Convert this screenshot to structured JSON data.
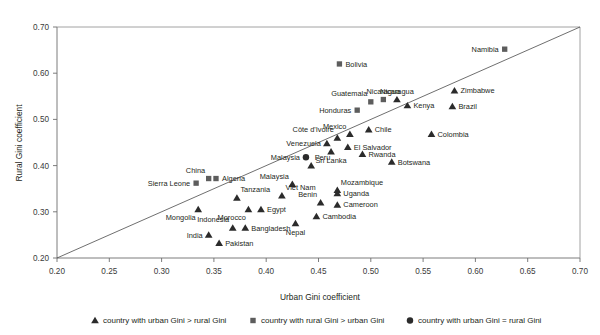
{
  "chart_data": {
    "type": "scatter",
    "title": "",
    "xlabel": "Urban Gini coefficient",
    "ylabel": "Rural Gini coefficient",
    "xlim": [
      0.2,
      0.7
    ],
    "ylim": [
      0.2,
      0.7
    ],
    "xticks": [
      "0.20",
      "0.25",
      "0.30",
      "0.35",
      "0.40",
      "0.45",
      "0.50",
      "0.55",
      "0.60",
      "0.65",
      "0.70"
    ],
    "yticks": [
      "0.20",
      "0.30",
      "0.40",
      "0.50",
      "0.60",
      "0.70"
    ],
    "grid": false,
    "reference_line": {
      "description": "45-degree equality line",
      "from": [
        0.2,
        0.2
      ],
      "to": [
        0.7,
        0.7
      ]
    },
    "legend": {
      "position": "bottom",
      "entries": [
        {
          "marker": "triangle",
          "label": "country with urban Gini > rural Gini"
        },
        {
          "marker": "square",
          "label": "country with rural Gini > urban Gini"
        },
        {
          "marker": "circle",
          "label": "country with urban Gini = rural Gini"
        }
      ]
    },
    "series": [
      {
        "name": "country with urban Gini > rural Gini",
        "marker": "triangle",
        "points": [
          {
            "label": "Mongolia",
            "x": 0.335,
            "y": 0.305,
            "label_pos": "below-left"
          },
          {
            "label": "India",
            "x": 0.345,
            "y": 0.25,
            "label_pos": "left"
          },
          {
            "label": "Indonesia",
            "x": 0.368,
            "y": 0.265,
            "label_pos": "above-left"
          },
          {
            "label": "Bangladesh",
            "x": 0.38,
            "y": 0.265,
            "label_pos": "right"
          },
          {
            "label": "Pakistan",
            "x": 0.355,
            "y": 0.232,
            "label_pos": "right"
          },
          {
            "label": "Morocco",
            "x": 0.383,
            "y": 0.305,
            "label_pos": "below-left"
          },
          {
            "label": "Tanzania",
            "x": 0.372,
            "y": 0.33,
            "label_pos": "above-right"
          },
          {
            "label": "Egypt",
            "x": 0.395,
            "y": 0.305,
            "label_pos": "right"
          },
          {
            "label": "Viet Nam",
            "x": 0.415,
            "y": 0.335,
            "label_pos": "above-right"
          },
          {
            "label": "Malaysia",
            "x": 0.425,
            "y": 0.36,
            "label_pos": "above-left"
          },
          {
            "label": "Nepal",
            "x": 0.428,
            "y": 0.275,
            "label_pos": "below"
          },
          {
            "label": "Cambodia",
            "x": 0.448,
            "y": 0.29,
            "label_pos": "right"
          },
          {
            "label": "Benin",
            "x": 0.452,
            "y": 0.32,
            "label_pos": "above-left"
          },
          {
            "label": "Peru",
            "x": 0.443,
            "y": 0.4,
            "label_pos": "above-right"
          },
          {
            "label": "Cameroon",
            "x": 0.468,
            "y": 0.315,
            "label_pos": "right"
          },
          {
            "label": "Uganda",
            "x": 0.468,
            "y": 0.34,
            "label_pos": "right"
          },
          {
            "label": "Mozambique",
            "x": 0.468,
            "y": 0.347,
            "label_pos": "above-right"
          },
          {
            "label": "Sri Lanka",
            "x": 0.462,
            "y": 0.43,
            "label_pos": "below"
          },
          {
            "label": "Venezuela",
            "x": 0.458,
            "y": 0.448,
            "label_pos": "left"
          },
          {
            "label": "Côte d'Ivoire",
            "x": 0.468,
            "y": 0.46,
            "label_pos": "above-left"
          },
          {
            "label": "El Salvador",
            "x": 0.478,
            "y": 0.44,
            "label_pos": "right"
          },
          {
            "label": "Mexico",
            "x": 0.48,
            "y": 0.468,
            "label_pos": "above-left"
          },
          {
            "label": "Rwanda",
            "x": 0.492,
            "y": 0.425,
            "label_pos": "right"
          },
          {
            "label": "Chile",
            "x": 0.498,
            "y": 0.478,
            "label_pos": "right"
          },
          {
            "label": "Botswana",
            "x": 0.52,
            "y": 0.408,
            "label_pos": "right"
          },
          {
            "label": "Kenya",
            "x": 0.535,
            "y": 0.53,
            "label_pos": "right"
          },
          {
            "label": "Nicaragua",
            "x": 0.525,
            "y": 0.543,
            "label_pos": "above"
          },
          {
            "label": "Colombia",
            "x": 0.558,
            "y": 0.468,
            "label_pos": "right"
          },
          {
            "label": "Brazil",
            "x": 0.578,
            "y": 0.528,
            "label_pos": "right"
          },
          {
            "label": "Zimbabwe",
            "x": 0.58,
            "y": 0.562,
            "label_pos": "right"
          }
        ]
      },
      {
        "name": "country with rural Gini > urban Gini",
        "marker": "square",
        "points": [
          {
            "label": "Sierra Leone",
            "x": 0.333,
            "y": 0.362,
            "label_pos": "left"
          },
          {
            "label": "China",
            "x": 0.345,
            "y": 0.372,
            "label_pos": "above-left"
          },
          {
            "label": "Algeria",
            "x": 0.352,
            "y": 0.372,
            "label_pos": "right"
          },
          {
            "label": "Honduras",
            "x": 0.487,
            "y": 0.52,
            "label_pos": "left"
          },
          {
            "label": "Guatemala",
            "x": 0.5,
            "y": 0.538,
            "label_pos": "above-left"
          },
          {
            "label": "Nicaragua",
            "x": 0.512,
            "y": 0.543,
            "label_pos": "above"
          },
          {
            "label": "Bolivia",
            "x": 0.47,
            "y": 0.62,
            "label_pos": "right"
          },
          {
            "label": "Namibia",
            "x": 0.628,
            "y": 0.652,
            "label_pos": "left"
          }
        ]
      },
      {
        "name": "country with urban Gini = rural Gini",
        "marker": "circle",
        "points": [
          {
            "label": "Malaysia",
            "x": 0.438,
            "y": 0.418,
            "label_pos": "left"
          }
        ]
      }
    ]
  },
  "colors": {
    "triangle": "#2b2b2b",
    "square": "#5d5d5d",
    "circle": "#2b2b2b",
    "axis": "#6e6e6e",
    "text": "#231f20",
    "background": "#ffffff"
  }
}
